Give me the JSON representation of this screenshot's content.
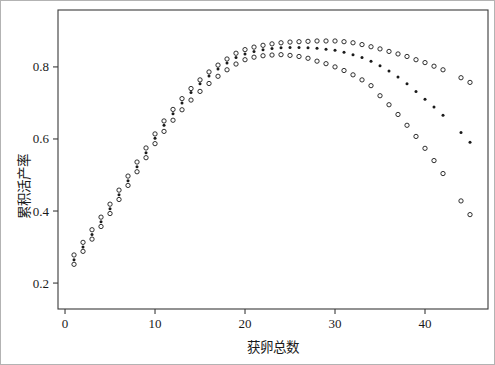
{
  "figure": {
    "background": "#ffffff",
    "frame_color": "#b3b3b3",
    "axis_color": "#3a3a3a",
    "point_color": "#1a1a1a"
  },
  "chart_data": {
    "type": "scatter",
    "title": "",
    "xlabel": "获卵总数",
    "ylabel": "累积活产率",
    "legend": "none",
    "grid": false,
    "xlim": [
      -0.78,
      47.0
    ],
    "ylim": [
      0.128,
      0.958
    ],
    "x_ticks": [
      0,
      10,
      20,
      30,
      40
    ],
    "y_ticks": [
      0.2,
      0.4,
      0.6,
      0.8
    ],
    "x": [
      1,
      2,
      3,
      4,
      5,
      6,
      7,
      8,
      9,
      10,
      11,
      12,
      13,
      14,
      15,
      16,
      17,
      18,
      19,
      20,
      21,
      22,
      23,
      24,
      25,
      26,
      27,
      28,
      29,
      30,
      31,
      32,
      33,
      34,
      35,
      36,
      37,
      38,
      39,
      40,
      41,
      42,
      44,
      45
    ],
    "series": [
      {
        "name": "upper-ci",
        "marker": "open-circle",
        "color": "#1a1a1a",
        "values": [
          0.278,
          0.313,
          0.348,
          0.383,
          0.419,
          0.458,
          0.497,
          0.536,
          0.575,
          0.614,
          0.65,
          0.682,
          0.712,
          0.74,
          0.764,
          0.786,
          0.805,
          0.822,
          0.838,
          0.848,
          0.855,
          0.86,
          0.864,
          0.867,
          0.869,
          0.87,
          0.871,
          0.872,
          0.872,
          0.872,
          0.87,
          0.867,
          0.862,
          0.856,
          0.85,
          0.843,
          0.836,
          0.829,
          0.82,
          0.812,
          0.802,
          0.792,
          0.77,
          0.757
        ]
      },
      {
        "name": "estimate",
        "marker": "filled-dot",
        "color": "#1a1a1a",
        "values": [
          0.265,
          0.3,
          0.335,
          0.37,
          0.406,
          0.445,
          0.484,
          0.523,
          0.562,
          0.602,
          0.638,
          0.67,
          0.7,
          0.729,
          0.753,
          0.775,
          0.794,
          0.811,
          0.826,
          0.836,
          0.843,
          0.848,
          0.851,
          0.853,
          0.854,
          0.854,
          0.853,
          0.852,
          0.849,
          0.846,
          0.841,
          0.834,
          0.826,
          0.816,
          0.803,
          0.789,
          0.772,
          0.753,
          0.732,
          0.71,
          0.689,
          0.666,
          0.618,
          0.591
        ]
      },
      {
        "name": "lower-ci",
        "marker": "open-circle",
        "color": "#1a1a1a",
        "values": [
          0.252,
          0.288,
          0.322,
          0.357,
          0.393,
          0.432,
          0.471,
          0.509,
          0.548,
          0.587,
          0.621,
          0.652,
          0.681,
          0.708,
          0.732,
          0.754,
          0.774,
          0.792,
          0.808,
          0.82,
          0.827,
          0.831,
          0.833,
          0.834,
          0.832,
          0.829,
          0.824,
          0.816,
          0.809,
          0.8,
          0.79,
          0.778,
          0.764,
          0.748,
          0.72,
          0.695,
          0.668,
          0.638,
          0.607,
          0.574,
          0.54,
          0.504,
          0.428,
          0.39
        ]
      }
    ]
  }
}
